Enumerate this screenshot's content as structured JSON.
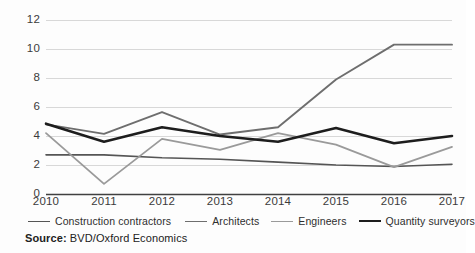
{
  "chart_data": {
    "type": "line",
    "title": "",
    "subtitle": "",
    "xlabel": "",
    "ylabel": "",
    "categories": [
      "2010",
      "2011",
      "2012",
      "2013",
      "2014",
      "2015",
      "2016",
      "2017"
    ],
    "x": [
      2010,
      2011,
      2012,
      2013,
      2014,
      2015,
      2016,
      2017
    ],
    "ylim": [
      0,
      12
    ],
    "yticks": [
      0,
      2,
      4,
      6,
      8,
      10,
      12
    ],
    "ytick_labels": [
      "0",
      "2",
      "4",
      "6",
      "8",
      "10",
      "12"
    ],
    "grid": true,
    "grid_axis": "y",
    "legend_position": "bottom",
    "series": [
      {
        "name": "Construction contractors",
        "color": "#555555",
        "width": 1.6,
        "values": [
          2.7,
          2.7,
          2.5,
          2.4,
          2.2,
          2.0,
          1.9,
          2.05
        ]
      },
      {
        "name": "Architects",
        "color": "#6e6e6e",
        "width": 1.9,
        "values": [
          4.8,
          4.15,
          5.65,
          4.1,
          4.6,
          7.9,
          10.3,
          10.3
        ]
      },
      {
        "name": "Engineers",
        "color": "#9a9a9a",
        "width": 1.8,
        "values": [
          4.2,
          0.7,
          3.8,
          3.05,
          4.2,
          3.4,
          1.85,
          3.25
        ]
      },
      {
        "name": "Quantity surveyors",
        "color": "#1d1d1d",
        "width": 2.6,
        "values": [
          4.85,
          3.6,
          4.6,
          4.0,
          3.6,
          4.55,
          3.5,
          4.0
        ]
      }
    ],
    "source_prefix": "Source:",
    "source_text": "BVD/Oxford Economics"
  },
  "colors": {
    "background": "#fdfdfd",
    "gridline": "#d8d8d8",
    "axis": "#404040",
    "tick_text": "#3b3b3b",
    "legend_text": "#2e2e2e",
    "source_text": "#222222"
  },
  "legend": [
    {
      "label": "Construction contractors",
      "icon": "line-swatch-icon"
    },
    {
      "label": "Architects",
      "icon": "line-swatch-icon"
    },
    {
      "label": "Engineers",
      "icon": "line-swatch-icon"
    },
    {
      "label": "Quantity surveyors",
      "icon": "line-swatch-icon"
    }
  ],
  "source": {
    "prefix": "Source:",
    "value": " BVD/Oxford Economics"
  }
}
